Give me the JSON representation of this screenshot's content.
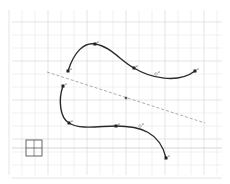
{
  "diagram": {
    "type": "curve-mirror",
    "grid": {
      "spacing": 13,
      "origin_x": 9,
      "origin_y": 9,
      "minor_color": "#e2e2e2",
      "major_color": "#c8c8c8",
      "axis_y": 148,
      "axis_color": "#bdbdbd"
    },
    "mirror_line": {
      "x1": 47,
      "y1": 72,
      "x2": 205,
      "y2": 123,
      "color": "#888888",
      "midpoint": {
        "x": 126,
        "y": 98
      }
    },
    "original_curve": {
      "path": "M68,71 C74,52 84,42 95,44 C110,46 122,62 134,68 C150,78 178,84 195,71",
      "color": "#2a2a2a",
      "anchors": [
        {
          "x": 68,
          "y": 71
        },
        {
          "x": 95,
          "y": 44
        },
        {
          "x": 134,
          "y": 68
        },
        {
          "x": 195,
          "y": 71
        }
      ],
      "handles": [
        {
          "x": 156,
          "y": 74
        }
      ]
    },
    "mirrored_curve": {
      "path": "M63,86 C58,100 60,118 69,123 C80,130 100,126 116,126 C140,126 160,132 166,158",
      "color": "#2a2a2a",
      "anchors": [
        {
          "x": 63,
          "y": 86
        },
        {
          "x": 69,
          "y": 123
        },
        {
          "x": 116,
          "y": 126
        },
        {
          "x": 166,
          "y": 158
        }
      ],
      "handles": [
        {
          "x": 140,
          "y": 126
        }
      ]
    },
    "origin_widget": {
      "x": 26,
      "y": 140,
      "size": 16,
      "color": "#555555"
    },
    "point_label": "ø"
  }
}
